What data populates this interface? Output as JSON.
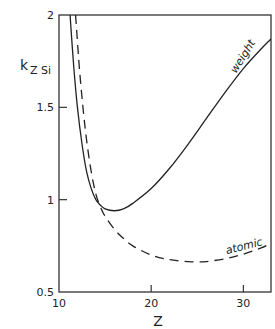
{
  "chart_data": {
    "type": "line",
    "title": "",
    "xlabel": "Z",
    "ylabel": "k",
    "ylabel_sub": "Z Si",
    "xlim": [
      10,
      33
    ],
    "ylim": [
      0.5,
      2
    ],
    "xticks": [
      10,
      20,
      30
    ],
    "xtick_labels": [
      "10",
      "20",
      "30"
    ],
    "yticks": [
      0.5,
      1,
      1.5,
      2
    ],
    "ytick_labels": [
      "0.5",
      "1",
      "1.5",
      "2"
    ],
    "grid": false,
    "series": [
      {
        "name": "weight",
        "style": "solid",
        "x": [
          11.2,
          11.6,
          12,
          12.5,
          13,
          13.5,
          14,
          14.5,
          15,
          16,
          17,
          18,
          20,
          22,
          24,
          26,
          28,
          30,
          32,
          33
        ],
        "y": [
          2.0,
          1.72,
          1.5,
          1.3,
          1.15,
          1.06,
          1.0,
          0.97,
          0.95,
          0.94,
          0.95,
          0.98,
          1.06,
          1.17,
          1.3,
          1.44,
          1.58,
          1.71,
          1.82,
          1.87
        ]
      },
      {
        "name": "atomic",
        "style": "dashed",
        "x": [
          11.8,
          12.2,
          12.6,
          13,
          13.5,
          14,
          14.5,
          15,
          16,
          17,
          18,
          20,
          22,
          24,
          25,
          26,
          28,
          30,
          32,
          33
        ],
        "y": [
          2.0,
          1.72,
          1.5,
          1.32,
          1.15,
          1.03,
          0.96,
          0.91,
          0.84,
          0.79,
          0.75,
          0.7,
          0.675,
          0.665,
          0.663,
          0.665,
          0.68,
          0.705,
          0.74,
          0.765
        ]
      }
    ],
    "annotations": [
      {
        "text": "weight",
        "series": "weight"
      },
      {
        "text": "atomic",
        "series": "atomic"
      }
    ]
  }
}
